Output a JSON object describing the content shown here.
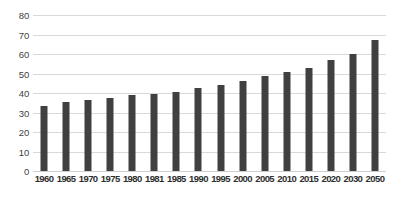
{
  "chart_data": {
    "type": "bar",
    "title": "",
    "xlabel": "",
    "ylabel": "",
    "ylim": [
      0,
      80
    ],
    "yticks": [
      0,
      10,
      20,
      30,
      40,
      50,
      60,
      70,
      80
    ],
    "grid": true,
    "legend": "none",
    "bar_color": "#404040",
    "gridline_color": "#d9d9d9",
    "background_color": "#ffffff",
    "categories": [
      "1960",
      "1965",
      "1970",
      "1975",
      "1980",
      "1981",
      "1985",
      "1990",
      "1995",
      "2000",
      "2005",
      "2010",
      "2015",
      "2020",
      "2030",
      "2050"
    ],
    "values": [
      33.3,
      35.2,
      36.3,
      37.3,
      39.0,
      39.3,
      40.7,
      42.5,
      44.3,
      46.0,
      48.5,
      51.0,
      53.0,
      57.0,
      60.0,
      67.0
    ]
  }
}
